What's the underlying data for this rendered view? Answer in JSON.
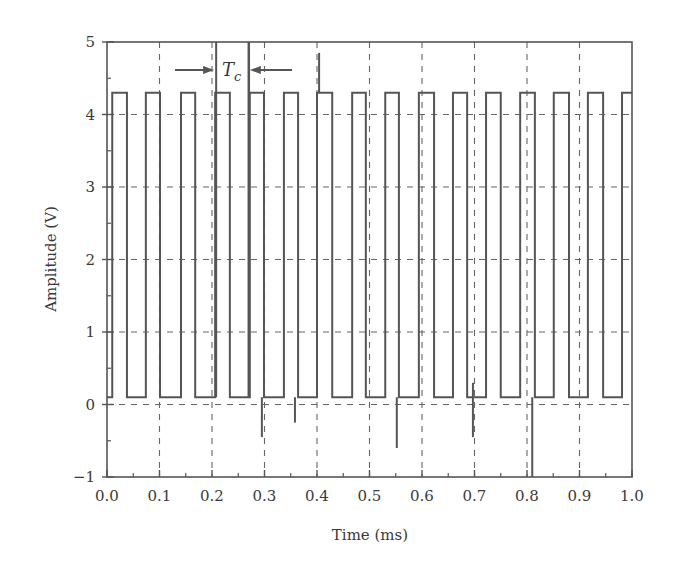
{
  "chart_data": {
    "type": "line",
    "title": "",
    "xlabel": "Time (ms)",
    "ylabel": "Amplitude (V)",
    "xlim": [
      0.0,
      1.0
    ],
    "ylim": [
      -1,
      5
    ],
    "x_ticks": [
      "0.0",
      "0.1",
      "0.2",
      "0.3",
      "0.4",
      "0.5",
      "0.6",
      "0.7",
      "0.8",
      "0.9",
      "1.0"
    ],
    "y_ticks": [
      "-1",
      "0",
      "1",
      "2",
      "3",
      "4",
      "5"
    ],
    "grid": "dashed",
    "legend": null,
    "series": [
      {
        "name": "square wave signal",
        "high_level": 4.3,
        "low_level": 0.1,
        "pulses_ms": [
          [
            0.01,
            0.038
          ],
          [
            0.074,
            0.101
          ],
          [
            0.141,
            0.168
          ],
          [
            0.206,
            0.234
          ],
          [
            0.272,
            0.299
          ],
          [
            0.337,
            0.364
          ],
          [
            0.4,
            0.429
          ],
          [
            0.467,
            0.493
          ],
          [
            0.53,
            0.556
          ],
          [
            0.594,
            0.623
          ],
          [
            0.659,
            0.686
          ],
          [
            0.722,
            0.75
          ],
          [
            0.787,
            0.815
          ],
          [
            0.851,
            0.88
          ],
          [
            0.916,
            0.945
          ],
          [
            0.981,
            1.0
          ]
        ],
        "spikes": [
          {
            "t": 0.295,
            "v": -0.45
          },
          {
            "t": 0.358,
            "v": -0.25
          },
          {
            "t": 0.404,
            "v": 4.85
          },
          {
            "t": 0.552,
            "v": -0.6
          },
          {
            "t": 0.697,
            "v": 0.3
          },
          {
            "t": 0.697,
            "v": -0.45
          },
          {
            "t": 0.81,
            "v": -1.0
          }
        ]
      }
    ],
    "annotations": [
      {
        "text": "T",
        "subscript": "c",
        "t_start": 0.206,
        "t_end": 0.272,
        "description": "period marker with inward arrows"
      }
    ]
  }
}
